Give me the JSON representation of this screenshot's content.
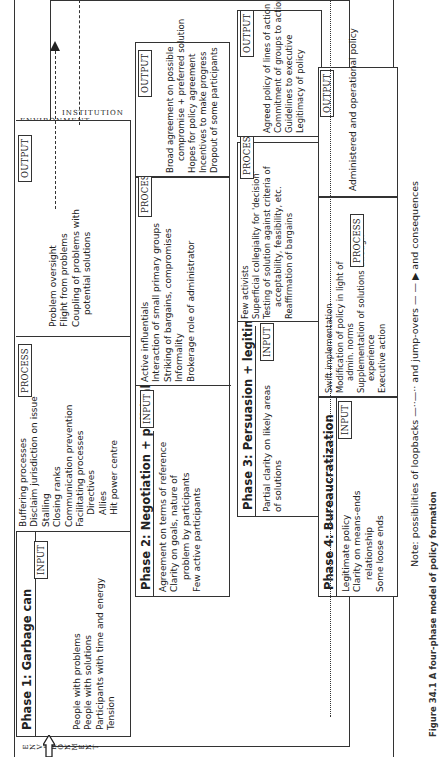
{
  "environment_label": "ENVIRONMENT",
  "institution_label": "INSTITUTION",
  "tags": {
    "input": "INPUT",
    "process": "PROCESS",
    "output": "OUTPUT"
  },
  "phases": [
    {
      "title": "Phase 1: Garbage can",
      "input": [
        "People with problems",
        "People with solutions",
        "Participants with time and energy",
        "Tension"
      ],
      "process": [
        "Buffering processes",
        "Disclaim jurisdiction on issue",
        "Stalling",
        "Closing ranks",
        "Communication prevention",
        "Facilitating processes",
        "Directives",
        "Allies",
        "Hit power centre"
      ],
      "output": [
        "Problem oversight",
        "Flight from problems",
        "Coupling of problems with",
        "potential solutions"
      ]
    },
    {
      "title": "Phase 2: Negotiation + political",
      "input": [
        "Agreement on terms of reference",
        "Clarity on goals, nature of",
        "problem by participants",
        "Few active participants"
      ],
      "process": [
        "Active influentials",
        "Interaction of small primary groups",
        "Striking of bargains, compromises",
        "Informality",
        "Brokerage role of administrator"
      ],
      "output": [
        "Broad agreement on possible",
        "compromise + preferred solution",
        "Hopes for policy agreement",
        "Incentives to make progress",
        "Dropout of some participants"
      ]
    },
    {
      "title": "Phase 3: Persuasion + legitimation",
      "input": [
        "Partial clarity on likely areas",
        "of solutions"
      ],
      "process": [
        "Few activists",
        "Superficial collegiality for 'decision'",
        "Testing of solution against criteria of",
        "acceptability, feasibility, etc.",
        "Reaffirmation of bargains"
      ],
      "output": [
        "Agreed policy of lines of action",
        "Commitment of groups to action",
        "Guidelines to executive",
        "Legitimacy of policy"
      ]
    },
    {
      "title": "Phase 4: Bureaucratization",
      "input": [
        "Legitimate policy",
        "Clarity on means-ends",
        "relationship",
        "Some loose ends"
      ],
      "process": [
        "Swift implementation",
        "Modification of policy in light of",
        "admin. norms",
        "Supplementation of solutions through",
        "experience",
        "Executive action"
      ],
      "output": [
        "Administered and operational policy"
      ]
    }
  ],
  "note": {
    "prefix": "Note: possibilities of loopbacks",
    "middle": "and jump-overs",
    "suffix": "and consequences"
  },
  "caption": "Figure 34.1  A four-phase model of policy formation"
}
